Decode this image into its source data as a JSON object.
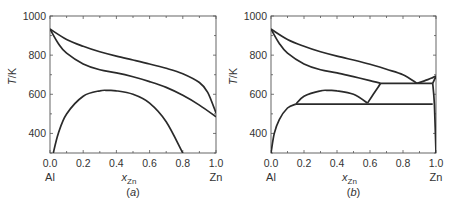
{
  "chart_data": [
    {
      "type": "line",
      "panel": "a",
      "caption": "(a)",
      "title": "",
      "xlabel": "x_Zn",
      "xlabel_main": "x",
      "xlabel_sub": "Zn",
      "ylabel": "T/K",
      "xlim": [
        0.0,
        1.0
      ],
      "ylim": [
        300,
        1000
      ],
      "xticks": [
        "0.0",
        "0.2",
        "0.4",
        "0.6",
        "0.8",
        "1.0"
      ],
      "yticks": [
        "400",
        "600",
        "800",
        "1000"
      ],
      "x_end_labels": {
        "left": "Al",
        "right": "Zn"
      },
      "grid": false,
      "series": [
        {
          "name": "liquidus",
          "x": [
            0.0,
            0.1,
            0.2,
            0.3,
            0.4,
            0.5,
            0.6,
            0.7,
            0.8,
            0.9,
            0.95,
            1.0
          ],
          "y": [
            933,
            880,
            845,
            817,
            795,
            775,
            755,
            733,
            705,
            660,
            610,
            505
          ]
        },
        {
          "name": "solidus",
          "x": [
            0.0,
            0.05,
            0.1,
            0.2,
            0.3,
            0.4,
            0.5,
            0.6,
            0.7,
            0.8,
            0.9,
            1.0
          ],
          "y": [
            933,
            860,
            810,
            755,
            725,
            710,
            690,
            665,
            635,
            595,
            545,
            485
          ]
        },
        {
          "name": "miscibility gap",
          "x": [
            0.02,
            0.05,
            0.1,
            0.2,
            0.3,
            0.35,
            0.4,
            0.5,
            0.6,
            0.7,
            0.8
          ],
          "y": [
            300,
            400,
            500,
            590,
            618,
            620,
            618,
            600,
            555,
            460,
            300
          ]
        }
      ]
    },
    {
      "type": "line",
      "panel": "b",
      "caption": "(b)",
      "title": "",
      "xlabel": "x_Zn",
      "xlabel_main": "x",
      "xlabel_sub": "Zn",
      "ylabel": "T/K",
      "xlim": [
        0.0,
        1.0
      ],
      "ylim": [
        300,
        1000
      ],
      "xticks": [
        "0.0",
        "0.2",
        "0.4",
        "0.6",
        "0.8",
        "1.0"
      ],
      "yticks": [
        "400",
        "600",
        "800",
        "1000"
      ],
      "x_end_labels": {
        "left": "Al",
        "right": "Zn"
      },
      "grid": false,
      "series": [
        {
          "name": "liquidus (Al side)",
          "x": [
            0.0,
            0.1,
            0.2,
            0.3,
            0.4,
            0.5,
            0.6,
            0.7,
            0.8,
            0.885
          ],
          "y": [
            933,
            880,
            845,
            817,
            795,
            775,
            753,
            728,
            700,
            656
          ]
        },
        {
          "name": "liquidus (Zn side)",
          "x": [
            0.885,
            0.95,
            0.98,
            1.0
          ],
          "y": [
            656,
            675,
            685,
            693
          ]
        },
        {
          "name": "solidus",
          "x": [
            0.0,
            0.05,
            0.1,
            0.2,
            0.3,
            0.4,
            0.5,
            0.6,
            0.665
          ],
          "y": [
            933,
            860,
            810,
            755,
            725,
            710,
            690,
            670,
            656
          ]
        },
        {
          "name": "eutectic line",
          "x": [
            0.665,
            0.98
          ],
          "y": [
            656,
            656
          ]
        },
        {
          "name": "monotectoid line",
          "x": [
            0.15,
            0.98
          ],
          "y": [
            550,
            550
          ]
        },
        {
          "name": "solvus (fcc, Al side)",
          "x": [
            0.0,
            0.02,
            0.05,
            0.1,
            0.15
          ],
          "y": [
            300,
            400,
            470,
            530,
            550
          ]
        },
        {
          "name": "miscibility gap dome",
          "x": [
            0.15,
            0.2,
            0.3,
            0.35,
            0.4,
            0.5,
            0.585
          ],
          "y": [
            550,
            590,
            618,
            620,
            618,
            600,
            555
          ]
        },
        {
          "name": "fcc boundary above monotectoid",
          "x": [
            0.585,
            0.62,
            0.665
          ],
          "y": [
            555,
            600,
            656
          ]
        },
        {
          "name": "Zn solvus",
          "x": [
            0.98,
            0.99,
            1.0
          ],
          "y": [
            656,
            550,
            300
          ]
        },
        {
          "name": "Zn solidus",
          "x": [
            0.98,
            1.0
          ],
          "y": [
            656,
            693
          ]
        }
      ]
    }
  ]
}
